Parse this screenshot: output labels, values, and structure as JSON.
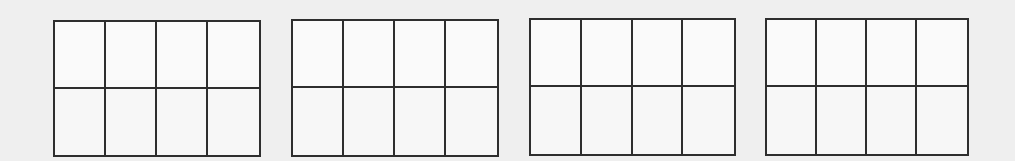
{
  "figure": {
    "background": "#efefef",
    "line_color": "#2e2e2e",
    "grids": [
      {
        "id": "grid-1",
        "rows": 2,
        "cols": 4,
        "x": 53,
        "y": 20,
        "width": 208,
        "height": 137
      },
      {
        "id": "grid-2",
        "rows": 2,
        "cols": 4,
        "x": 291,
        "y": 19,
        "width": 208,
        "height": 138
      },
      {
        "id": "grid-3",
        "rows": 2,
        "cols": 4,
        "x": 529,
        "y": 18,
        "width": 207,
        "height": 138
      },
      {
        "id": "grid-4",
        "rows": 2,
        "cols": 4,
        "x": 765,
        "y": 18,
        "width": 204,
        "height": 138
      }
    ]
  }
}
